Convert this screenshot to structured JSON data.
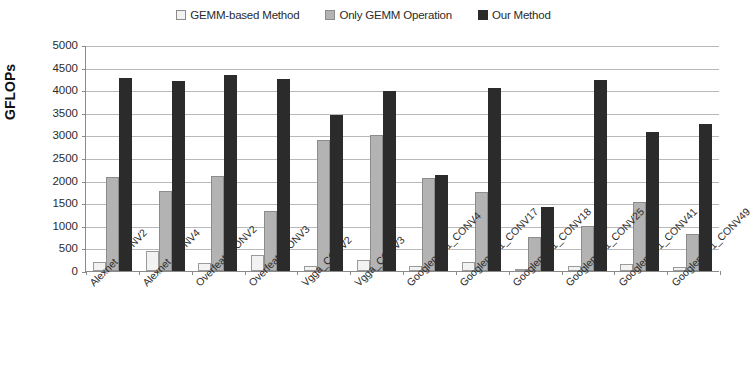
{
  "chart_data": {
    "type": "bar",
    "title": "",
    "xlabel": "",
    "ylabel": "GFLOPs",
    "ylim": [
      0,
      5000
    ],
    "ytick_step": 500,
    "yticks": [
      "5000",
      "4500",
      "4000",
      "3500",
      "3000",
      "2500",
      "2000",
      "1500",
      "1000",
      "500",
      "0"
    ],
    "grid": true,
    "legend_position": "top-center",
    "categories": [
      "Alexnet_CONV2",
      "Alexnet_CONV4",
      "Overfeat_CONV2",
      "Overfeat_CONV3",
      "Vgga_CONV2",
      "Vgga_CONV3",
      "Googlenetv1_CONV4",
      "Googlenetv1_CONV17",
      "Googlenetv1_CONV18",
      "Googlenetv1_CONV25",
      "Googlenetv1_CONV41",
      "Googlenetv1_CONV49"
    ],
    "series": [
      {
        "name": "GEMM-based Method",
        "color": "#f2f2f2",
        "values": [
          200,
          450,
          180,
          350,
          110,
          240,
          110,
          190,
          30,
          110,
          160,
          80
        ]
      },
      {
        "name": "Only GEMM Operation",
        "color": "#b3b3b3",
        "values": [
          2080,
          1770,
          2100,
          1330,
          2900,
          3000,
          2050,
          1740,
          750,
          1000,
          1520,
          820
        ]
      },
      {
        "name": "Our Method",
        "color": "#2b2b2b",
        "values": [
          4270,
          4200,
          4340,
          4250,
          3450,
          3980,
          2130,
          4050,
          1420,
          4220,
          3080,
          3250
        ]
      }
    ]
  }
}
